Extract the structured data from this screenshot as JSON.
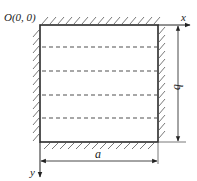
{
  "diagram": {
    "origin_label": "O(0, 0)",
    "x_axis_label": "x",
    "y_axis_label": "y",
    "width_label": "a",
    "height_label": "b",
    "plate": {
      "left": 40,
      "top": 25,
      "right": 158,
      "bottom": 142
    },
    "dashed_lines_y": [
      47,
      71,
      95,
      118
    ],
    "colors": {
      "edge": "#2a2a2a",
      "dashed": "#8a8a8a",
      "hatch": "#6a6a6a",
      "dimension": "#333333"
    }
  }
}
